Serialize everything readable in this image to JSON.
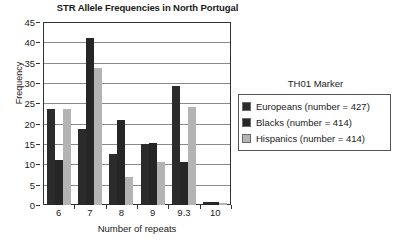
{
  "chart_data": {
    "type": "bar",
    "title": "STR Allele Frequencies in North Portugal",
    "xlabel": "Number of repeats",
    "ylabel": "Frequency",
    "ylim": [
      0,
      45
    ],
    "ytick_step": 5,
    "yticks": [
      0,
      5,
      10,
      15,
      20,
      25,
      30,
      35,
      40,
      45
    ],
    "grid": true,
    "legend_position": "right",
    "legend_title": "TH01 Marker",
    "categories": [
      "6",
      "7",
      "8",
      "9",
      "9.3",
      "10"
    ],
    "series": [
      {
        "name": "Europeans (number = 427)",
        "color": "#2b2b2b",
        "values": [
          23.5,
          18.7,
          12.5,
          14.9,
          29.2,
          0.7
        ]
      },
      {
        "name": "Blacks (number = 414)",
        "color": "#262626",
        "values": [
          11.0,
          41.0,
          20.8,
          15.2,
          10.6,
          0.8
        ]
      },
      {
        "name": "Hispanics (number = 414)",
        "color": "#b4b4b4",
        "values": [
          23.7,
          33.8,
          6.9,
          10.5,
          24.2,
          0.5
        ]
      }
    ]
  }
}
